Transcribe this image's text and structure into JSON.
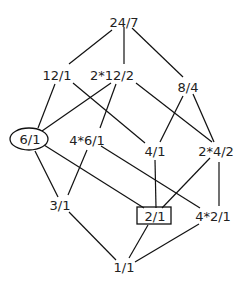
{
  "diagram": {
    "type": "lattice",
    "nodes": [
      {
        "id": "n24_7",
        "label": "24/7",
        "x": 124,
        "y": 22,
        "shape": "none"
      },
      {
        "id": "n12_1",
        "label": "12/1",
        "x": 57,
        "y": 75,
        "shape": "none"
      },
      {
        "id": "n2x12_2",
        "label": "2*12/2",
        "x": 112,
        "y": 75,
        "shape": "none"
      },
      {
        "id": "n8_4",
        "label": "8/4",
        "x": 188,
        "y": 87,
        "shape": "none"
      },
      {
        "id": "n6_1",
        "label": "6/1",
        "x": 30,
        "y": 139,
        "shape": "ellipse"
      },
      {
        "id": "n4x6_1",
        "label": "4*6/1",
        "x": 87,
        "y": 140,
        "shape": "none"
      },
      {
        "id": "n4_1",
        "label": "4/1",
        "x": 155,
        "y": 151,
        "shape": "none"
      },
      {
        "id": "n2x4_2",
        "label": "2*4/2",
        "x": 216,
        "y": 151,
        "shape": "none"
      },
      {
        "id": "n3_1",
        "label": "3/1",
        "x": 60,
        "y": 205,
        "shape": "none"
      },
      {
        "id": "n2_1",
        "label": "2/1",
        "x": 155,
        "y": 216,
        "shape": "box"
      },
      {
        "id": "n4x2_1",
        "label": "4*2/1",
        "x": 213,
        "y": 216,
        "shape": "none"
      },
      {
        "id": "n1_1",
        "label": "1/1",
        "x": 124,
        "y": 267,
        "shape": "none"
      }
    ],
    "edges": [
      {
        "from": "n24_7",
        "to": "n12_1",
        "x1": 112,
        "y1": 30,
        "x2": 69,
        "y2": 64
      },
      {
        "from": "n24_7",
        "to": "n2x12_2",
        "x1": 124,
        "y1": 27,
        "x2": 124,
        "y2": 64
      },
      {
        "from": "n24_7",
        "to": "n8_4",
        "x1": 132,
        "y1": 28,
        "x2": 183,
        "y2": 77
      },
      {
        "from": "n12_1",
        "to": "n6_1",
        "x1": 55,
        "y1": 84,
        "x2": 38,
        "y2": 128
      },
      {
        "from": "n12_1",
        "to": "n4_1",
        "x1": 73,
        "y1": 83,
        "x2": 145,
        "y2": 143
      },
      {
        "from": "n2x12_2",
        "to": "n6_1",
        "x1": 111,
        "y1": 83,
        "x2": 42,
        "y2": 131
      },
      {
        "from": "n2x12_2",
        "to": "n4x6_1",
        "x1": 116,
        "y1": 84,
        "x2": 100,
        "y2": 128
      },
      {
        "from": "n2x12_2",
        "to": "n2x4_2",
        "x1": 136,
        "y1": 83,
        "x2": 212,
        "y2": 142
      },
      {
        "from": "n8_4",
        "to": "n4_1",
        "x1": 183,
        "y1": 96,
        "x2": 160,
        "y2": 142
      },
      {
        "from": "n8_4",
        "to": "n2x4_2",
        "x1": 193,
        "y1": 94,
        "x2": 214,
        "y2": 142
      },
      {
        "from": "n6_1",
        "to": "n3_1",
        "x1": 35,
        "y1": 151,
        "x2": 58,
        "y2": 197
      },
      {
        "from": "n6_1",
        "to": "n2_1",
        "x1": 44,
        "y1": 145,
        "x2": 144,
        "y2": 208
      },
      {
        "from": "n4x6_1",
        "to": "n3_1",
        "x1": 87,
        "y1": 150,
        "x2": 68,
        "y2": 195
      },
      {
        "from": "n4x6_1",
        "to": "n4x2_1",
        "x1": 101,
        "y1": 146,
        "x2": 200,
        "y2": 208
      },
      {
        "from": "n4_1",
        "to": "n2_1",
        "x1": 155,
        "y1": 160,
        "x2": 156,
        "y2": 208
      },
      {
        "from": "n2x4_2",
        "to": "n2_1",
        "x1": 210,
        "y1": 158,
        "x2": 162,
        "y2": 208
      },
      {
        "from": "n2x4_2",
        "to": "n4x2_1",
        "x1": 219,
        "y1": 162,
        "x2": 219,
        "y2": 206
      },
      {
        "from": "n3_1",
        "to": "n1_1",
        "x1": 69,
        "y1": 212,
        "x2": 116,
        "y2": 260
      },
      {
        "from": "n2_1",
        "to": "n1_1",
        "x1": 148,
        "y1": 225,
        "x2": 129,
        "y2": 258
      },
      {
        "from": "n4x2_1",
        "to": "n1_1",
        "x1": 199,
        "y1": 224,
        "x2": 135,
        "y2": 262
      }
    ]
  }
}
